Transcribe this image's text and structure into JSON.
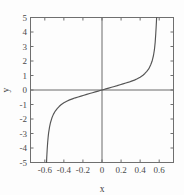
{
  "figure": {
    "background": "#fdfdfd",
    "frame_color": "#6f6f6f",
    "curve_color": "#555555",
    "axis_color": "#6a6a6a"
  },
  "chart_data": {
    "type": "line",
    "title": "",
    "subtitle": "",
    "xlabel": "x",
    "ylabel": "y",
    "xlim": [
      -0.75,
      0.75
    ],
    "ylim": [
      -5,
      5
    ],
    "grid": false,
    "legend": null,
    "frame": "box",
    "tick_direction": "in",
    "xticks": [
      -0.6,
      -0.4,
      -0.2,
      0,
      0.2,
      0.4,
      0.6
    ],
    "xticklabels": [
      "-0.6",
      "-0.4",
      "-0.2",
      "0",
      "0.2",
      "0.4",
      "0.6"
    ],
    "yticks": [
      -5,
      -4,
      -3,
      -2,
      -1,
      0,
      1,
      2,
      3,
      4,
      5
    ],
    "yticklabels": [
      "-5",
      "-4",
      "-3",
      "-2",
      "-1",
      "0",
      "1",
      "2",
      "3",
      "4",
      "5"
    ],
    "annotations": [
      {
        "text": "vertical asymptote near x = -0.58"
      },
      {
        "text": "vertical asymptote near x = 0.57"
      },
      {
        "text": "curve passes through origin (0, 0)"
      }
    ],
    "series": [
      {
        "name": "curve",
        "x": [
          -0.582,
          -0.58,
          -0.578,
          -0.575,
          -0.57,
          -0.565,
          -0.56,
          -0.55,
          -0.54,
          -0.525,
          -0.51,
          -0.49,
          -0.47,
          -0.45,
          -0.43,
          -0.4,
          -0.37,
          -0.34,
          -0.31,
          -0.28,
          -0.25,
          -0.22,
          -0.19,
          -0.16,
          -0.13,
          -0.1,
          -0.07,
          -0.04,
          -0.02,
          0.0,
          0.02,
          0.04,
          0.07,
          0.1,
          0.13,
          0.16,
          0.19,
          0.22,
          0.25,
          0.28,
          0.31,
          0.34,
          0.37,
          0.4,
          0.43,
          0.45,
          0.47,
          0.49,
          0.51,
          0.525,
          0.54,
          0.55,
          0.558,
          0.564,
          0.568,
          0.571,
          0.573
        ],
        "y": [
          -5.0,
          -4.7,
          -4.45,
          -4.1,
          -3.62,
          -3.25,
          -2.96,
          -2.54,
          -2.24,
          -1.92,
          -1.68,
          -1.45,
          -1.28,
          -1.14,
          -1.02,
          -0.88,
          -0.77,
          -0.68,
          -0.61,
          -0.54,
          -0.48,
          -0.42,
          -0.36,
          -0.3,
          -0.245,
          -0.188,
          -0.131,
          -0.075,
          -0.037,
          0.0,
          0.037,
          0.075,
          0.131,
          0.188,
          0.245,
          0.3,
          0.36,
          0.42,
          0.48,
          0.54,
          0.61,
          0.68,
          0.77,
          0.88,
          1.02,
          1.14,
          1.28,
          1.45,
          1.72,
          1.98,
          2.38,
          2.78,
          3.3,
          3.9,
          4.35,
          4.72,
          5.0
        ]
      }
    ]
  },
  "labels": {
    "x_axis_title": "x",
    "y_axis_title": "y"
  }
}
